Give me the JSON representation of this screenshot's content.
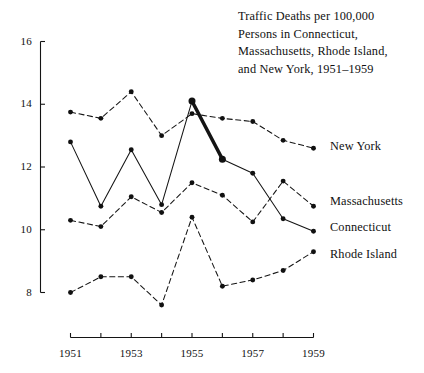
{
  "chart_data": {
    "type": "line",
    "title": "Traffic Deaths per 100,000 Persons in Connecticut, Massachusetts, Rhode Island, and New York, 1951–1959",
    "title_lines": [
      "Traffic Deaths per 100,000",
      "Persons in Connecticut,",
      "Massachusetts, Rhode Island,",
      "and New York, 1951–1959"
    ],
    "xlabel": "",
    "ylabel": "",
    "x": [
      1951,
      1952,
      1953,
      1954,
      1955,
      1956,
      1957,
      1958,
      1959
    ],
    "categories": [
      "1951",
      "1952",
      "1953",
      "1954",
      "1955",
      "1956",
      "1957",
      "1958",
      "1959"
    ],
    "xtick_labels": [
      "1951",
      "",
      "1953",
      "",
      "1955",
      "",
      "1957",
      "",
      "1959"
    ],
    "xlim": [
      1951,
      1959
    ],
    "ylim": [
      8,
      16
    ],
    "ytick_labels": [
      "8",
      "10",
      "12",
      "14",
      "16"
    ],
    "yticks": [
      8,
      10,
      12,
      14,
      16
    ],
    "grid": false,
    "legend_position": "right-inline",
    "series": [
      {
        "name": "New York",
        "style": "dashed",
        "values": [
          13.75,
          13.55,
          14.4,
          13.0,
          13.7,
          13.55,
          13.45,
          12.85,
          12.6
        ]
      },
      {
        "name": "Connecticut",
        "style": "solid",
        "values": [
          12.8,
          10.75,
          12.55,
          10.8,
          14.1,
          12.25,
          11.8,
          10.35,
          9.95
        ],
        "highlight_segment": {
          "from_year": 1955,
          "to_year": 1956,
          "note": "bold segment"
        }
      },
      {
        "name": "Massachusetts",
        "style": "dashed",
        "values": [
          10.3,
          10.1,
          11.05,
          10.55,
          11.5,
          11.1,
          10.25,
          11.55,
          10.75
        ]
      },
      {
        "name": "Rhode Island",
        "style": "dashed",
        "values": [
          8.0,
          8.5,
          8.5,
          7.6,
          10.4,
          8.2,
          8.4,
          8.7,
          9.3
        ]
      }
    ],
    "colors": {
      "ink": "#141414",
      "background": "#ffffff",
      "marker": "#111111"
    }
  }
}
